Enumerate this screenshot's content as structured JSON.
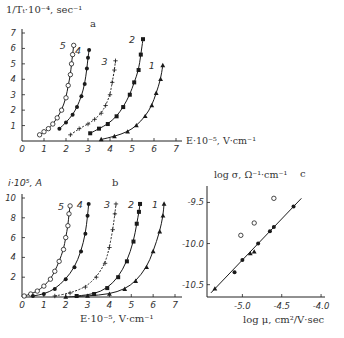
{
  "chart_data": [
    {
      "panel": "a",
      "type": "scatter",
      "title": "a",
      "xlabel": "E·10⁻⁵, V·cm⁻¹",
      "ylabel": "1/Tₜ·10⁻⁴, sec⁻¹",
      "xlim": [
        0,
        7
      ],
      "ylim": [
        0,
        7
      ],
      "xticks": [
        "0",
        "1",
        "2",
        "3",
        "4",
        "5",
        "6",
        "7"
      ],
      "yticks": [
        "1",
        "2",
        "3",
        "4",
        "5",
        "6",
        "7"
      ],
      "series": [
        {
          "name": "5",
          "marker": "open-circle",
          "x": [
            0.8,
            1.0,
            1.2,
            1.4,
            1.6,
            1.8,
            2.0,
            2.1,
            2.2,
            2.25,
            2.3,
            2.35
          ],
          "y": [
            0.4,
            0.6,
            0.8,
            1.1,
            1.5,
            2.0,
            2.8,
            3.6,
            4.3,
            5.0,
            5.6,
            6.2
          ]
        },
        {
          "name": "4",
          "marker": "filled-circle",
          "x": [
            1.7,
            2.0,
            2.3,
            2.5,
            2.7,
            2.85,
            2.95,
            3.0,
            3.05
          ],
          "y": [
            0.8,
            1.2,
            1.7,
            2.2,
            2.9,
            3.7,
            4.7,
            5.4,
            5.9
          ]
        },
        {
          "name": "3",
          "marker": "plus",
          "x": [
            2.2,
            2.6,
            3.0,
            3.3,
            3.6,
            3.8,
            4.0,
            4.1,
            4.2,
            4.25
          ],
          "y": [
            0.4,
            0.8,
            1.1,
            1.4,
            1.8,
            2.3,
            3.0,
            3.8,
            4.6,
            5.2
          ]
        },
        {
          "name": "2",
          "marker": "filled-square",
          "x": [
            3.1,
            3.5,
            3.9,
            4.3,
            4.6,
            4.9,
            5.1,
            5.3,
            5.4,
            5.5
          ],
          "y": [
            0.5,
            0.8,
            1.1,
            1.6,
            2.2,
            3.0,
            3.8,
            4.6,
            5.6,
            6.6
          ]
        },
        {
          "name": "1",
          "marker": "filled-triangle",
          "x": [
            3.6,
            4.2,
            4.8,
            5.2,
            5.6,
            5.9,
            6.1,
            6.3,
            6.4
          ],
          "y": [
            0.1,
            0.3,
            0.6,
            1.0,
            1.6,
            2.3,
            3.1,
            4.0,
            4.9
          ]
        }
      ]
    },
    {
      "panel": "b",
      "type": "scatter",
      "title": "b",
      "xlabel": "E·10⁻⁵, V·cm⁻¹",
      "ylabel": "i·10⁵, A",
      "xlim": [
        0,
        7
      ],
      "ylim": [
        0,
        10
      ],
      "xticks": [
        "0",
        "1",
        "2",
        "3",
        "4",
        "5",
        "6",
        "7"
      ],
      "yticks": [
        "2",
        "4",
        "6",
        "8",
        "10"
      ],
      "series": [
        {
          "name": "5",
          "marker": "open-circle",
          "x": [
            0.1,
            0.4,
            0.7,
            1.0,
            1.3,
            1.5,
            1.7,
            1.9,
            2.0,
            2.1,
            2.15,
            2.2
          ],
          "y": [
            0.1,
            0.3,
            0.6,
            1.1,
            1.8,
            2.6,
            3.6,
            4.8,
            6.0,
            7.2,
            8.4,
            9.2
          ]
        },
        {
          "name": "4",
          "marker": "filled-circle",
          "x": [
            0.5,
            1.0,
            1.5,
            2.0,
            2.4,
            2.7,
            2.9,
            3.0,
            3.05
          ],
          "y": [
            0.1,
            0.3,
            0.8,
            1.8,
            3.0,
            4.6,
            6.4,
            8.2,
            9.4
          ]
        },
        {
          "name": "3",
          "marker": "plus",
          "x": [
            1.5,
            2.2,
            2.9,
            3.4,
            3.8,
            4.0,
            4.15,
            4.25,
            4.3
          ],
          "y": [
            0.1,
            0.4,
            1.0,
            2.0,
            3.4,
            5.0,
            6.8,
            8.4,
            9.4
          ]
        },
        {
          "name": "2",
          "marker": "filled-square",
          "x": [
            2.5,
            3.3,
            3.9,
            4.4,
            4.8,
            5.1,
            5.25,
            5.35,
            5.4
          ],
          "y": [
            0.1,
            0.3,
            0.9,
            2.0,
            3.6,
            5.6,
            7.4,
            8.6,
            9.4
          ]
        },
        {
          "name": "1",
          "marker": "filled-triangle",
          "x": [
            2.0,
            3.0,
            4.0,
            4.7,
            5.2,
            5.7,
            6.0,
            6.3,
            6.45,
            6.5
          ],
          "y": [
            0.0,
            0.1,
            0.3,
            0.8,
            1.6,
            3.0,
            4.6,
            6.6,
            8.2,
            9.4
          ]
        }
      ]
    },
    {
      "panel": "c",
      "type": "scatter",
      "title": "c",
      "xlabel": "log μ, cm²/V·sec",
      "ylabel": "log σ, Ω⁻¹·cm⁻¹",
      "xlim": [
        -5.45,
        -3.95
      ],
      "ylim": [
        -10.65,
        -9.3
      ],
      "xticks": [
        "-5.0",
        "-4.5",
        "-4.0"
      ],
      "yticks": [
        "-9.5",
        "-10.0",
        "-10.5"
      ],
      "series": [
        {
          "name": "open circles",
          "marker": "open-circle",
          "x": [
            -5.02,
            -4.85,
            -4.6
          ],
          "y": [
            -9.9,
            -9.75,
            -9.45
          ]
        },
        {
          "name": "filled points",
          "marker": "filled",
          "x": [
            -5.35,
            -5.1,
            -5.0,
            -4.9,
            -4.85,
            -4.8,
            -4.65,
            -4.6,
            -4.35
          ],
          "y": [
            -10.55,
            -10.35,
            -10.2,
            -10.12,
            -10.1,
            -10.0,
            -9.85,
            -9.8,
            -9.55
          ]
        }
      ],
      "fit_line": {
        "x": [
          -5.4,
          -4.25
        ],
        "y": [
          -10.6,
          -9.45
        ]
      }
    }
  ],
  "labels": {
    "panel_a": "a",
    "panel_b": "b",
    "panel_c": "c",
    "a_ylabel": "1/Tₜ·10⁻⁴, sec⁻¹",
    "a_xlabel": "E·10⁻⁵, V·cm⁻¹",
    "b_ylabel": "i·10⁵, A",
    "b_xlabel": "E·10⁻⁵, V·cm⁻¹",
    "c_ylabel": "log σ, Ω⁻¹·cm⁻¹",
    "c_xlabel": "log μ, cm²/V·sec"
  }
}
